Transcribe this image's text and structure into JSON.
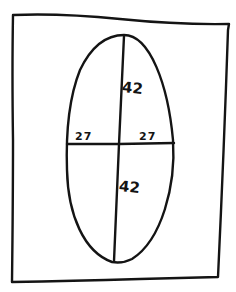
{
  "diagram": {
    "colors": {
      "ink": "#141414",
      "paper": "#ffffff"
    },
    "frame": {
      "shape": "rectangle"
    },
    "ellipse": {
      "semi_major_axis": "42",
      "semi_minor_axis": "27"
    },
    "labels": {
      "upper_vertical": "42",
      "lower_vertical": "42",
      "left_horizontal": "27",
      "right_horizontal": "27"
    }
  }
}
